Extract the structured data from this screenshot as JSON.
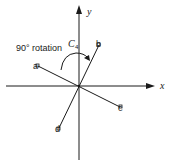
{
  "diagram": {
    "axes": {
      "x_label": "x",
      "y_label": "y"
    },
    "rotation_label": "90° rotation",
    "operator": {
      "symbol": "C",
      "subscript": "4"
    },
    "points": [
      {
        "id": "a",
        "label": "a"
      },
      {
        "id": "b",
        "label": "b"
      },
      {
        "id": "c",
        "label": "c"
      },
      {
        "id": "d",
        "label": "d"
      }
    ],
    "colors": {
      "line": "#1a1a1a",
      "background": "#ffffff"
    }
  }
}
